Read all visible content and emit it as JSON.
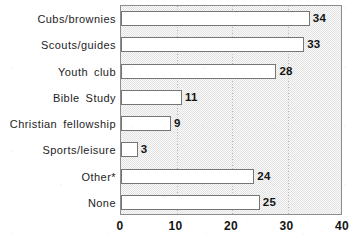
{
  "chart_data": {
    "type": "bar",
    "orientation": "horizontal",
    "title": "",
    "subtitle": "",
    "xlabel": "",
    "ylabel": "",
    "xlim": [
      0,
      40
    ],
    "xticks": [
      "0",
      "10",
      "20",
      "30",
      "40"
    ],
    "xtick_values": [
      0,
      10,
      20,
      30,
      40
    ],
    "gridlines": {
      "vertical_at": [
        10,
        20,
        30
      ],
      "style": "dotted",
      "horizontal": false
    },
    "legend": {
      "present": false,
      "position": "none"
    },
    "categories": [
      "Cubs/brownies",
      "Scouts/guides",
      "Youth club",
      "Bible Study",
      "Christian fellowship",
      "Sports/leisure",
      "Other*",
      "None"
    ],
    "values": [
      34,
      33,
      28,
      11,
      9,
      3,
      24,
      25
    ],
    "value_labels": [
      "34",
      "33",
      "28",
      "11",
      "9",
      "3",
      "24",
      "25"
    ],
    "bar_style": {
      "fill": "#ffffff",
      "border": "#757575"
    },
    "plot_background": "#f2f2f2",
    "axis_color": "#8d8d8d"
  },
  "colors": {
    "page_background": "#ffffff",
    "plot_background": "#f2f2f2",
    "bar_fill": "#ffffff",
    "bar_border": "#757575",
    "gridline": "#b9b9b9",
    "text": "#1d1d1d",
    "axis": "#8d8d8d"
  }
}
